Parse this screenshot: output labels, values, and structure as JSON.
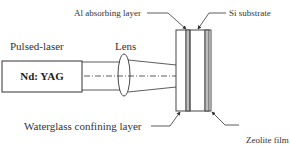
{
  "diagram": {
    "type": "schematic",
    "labels": {
      "pulsed_laser": "Pulsed-laser",
      "laser_source": "Nd: YAG",
      "lens": "Lens",
      "al_layer": "Al absorbing layer",
      "si_substrate": "Si substrate",
      "waterglass": "Waterglass confining layer",
      "zeolite": "Zeolite film"
    },
    "colors": {
      "stroke": "#333333",
      "layer_fill": "#bdbdbd",
      "background": "#ffffff"
    },
    "components": [
      {
        "id": "laser-box",
        "label": "Nd: YAG"
      },
      {
        "id": "lens",
        "label": "Lens"
      },
      {
        "id": "sample-stack",
        "layers": [
          "Waterglass confining layer",
          "Al absorbing layer",
          "Si substrate",
          "Zeolite film"
        ]
      }
    ]
  }
}
